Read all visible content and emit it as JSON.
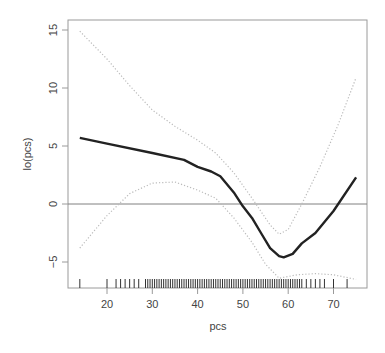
{
  "chart_data": {
    "type": "line",
    "title": "",
    "xlabel": "pcs",
    "ylabel": "lo(pcs)",
    "xlim": [
      14,
      75
    ],
    "ylim": [
      -6.8,
      15.5
    ],
    "xticks": [
      20,
      30,
      40,
      50,
      60,
      70
    ],
    "yticks": [
      -5,
      0,
      5,
      10,
      15
    ],
    "grid": false,
    "legend": null,
    "reference_line": {
      "y": 0,
      "color": "#808080"
    },
    "series": [
      {
        "name": "lo(pcs) fit",
        "style": "solid",
        "color": "#222222",
        "x": [
          14,
          20,
          30,
          37,
          40,
          43,
          45,
          48,
          50,
          52,
          54,
          56,
          58,
          59,
          61,
          63,
          66,
          70,
          75
        ],
        "y": [
          5.7,
          5.2,
          4.4,
          3.8,
          3.2,
          2.8,
          2.4,
          1.0,
          -0.2,
          -1.2,
          -2.5,
          -3.8,
          -4.5,
          -4.6,
          -4.3,
          -3.4,
          -2.5,
          -0.6,
          2.3
        ]
      },
      {
        "name": "upper 2 SE band",
        "style": "dotted",
        "color": "#bbbbbb",
        "x": [
          14,
          20,
          25,
          30,
          35,
          40,
          44,
          48,
          52,
          56,
          58,
          60,
          63,
          67,
          71,
          75
        ],
        "y": [
          14.9,
          12.5,
          10.2,
          8.1,
          6.7,
          5.5,
          4.4,
          2.7,
          0.5,
          -1.8,
          -2.6,
          -2.2,
          0.0,
          3.2,
          6.8,
          10.9
        ]
      },
      {
        "name": "lower 2 SE band",
        "style": "dotted",
        "color": "#bbbbbb",
        "x": [
          14,
          20,
          25,
          30,
          35,
          40,
          44,
          48,
          52,
          55,
          58,
          62,
          66,
          70,
          75
        ],
        "y": [
          -3.8,
          -1.0,
          0.9,
          1.8,
          1.9,
          1.2,
          0.5,
          -1.2,
          -3.3,
          -5.2,
          -6.4,
          -6.1,
          -6.0,
          -6.1,
          -6.5
        ]
      }
    ],
    "rug": {
      "description": "observation ticks along x axis",
      "x": [
        14,
        20,
        22,
        23,
        24,
        25,
        26,
        27,
        28.5,
        29,
        29.5,
        30,
        30.5,
        31,
        31.5,
        32,
        32.5,
        33,
        33.5,
        34,
        34.5,
        35,
        35.5,
        36,
        36.5,
        37,
        37.5,
        38,
        38.5,
        39,
        39.5,
        40,
        40.5,
        41,
        41.5,
        42,
        42.5,
        43,
        43.5,
        44,
        44.5,
        45,
        45.5,
        46,
        46.5,
        47,
        47.5,
        48,
        48.5,
        49,
        49.5,
        50,
        50.5,
        51,
        51.5,
        52,
        52.5,
        53,
        53.5,
        54,
        54.5,
        55,
        55.5,
        56,
        56.5,
        57,
        57.5,
        58,
        58.5,
        59,
        59.5,
        60,
        60.5,
        61,
        61.5,
        62,
        62.5,
        63,
        64,
        65,
        66,
        67,
        68,
        70,
        73
      ]
    }
  }
}
